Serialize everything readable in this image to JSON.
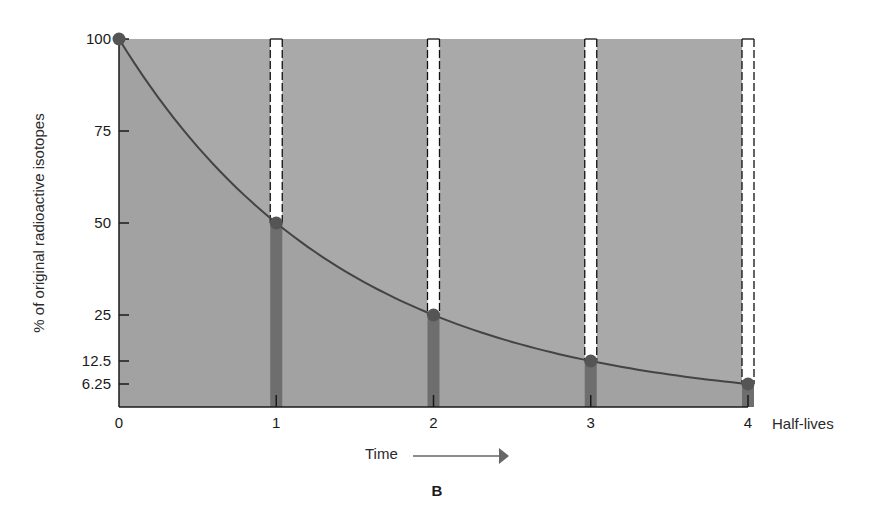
{
  "chart_data": {
    "type": "line",
    "title": "",
    "panel_label": "B",
    "xlabel": "Half-lives",
    "ylabel": "% of original radioactive isotopes",
    "time_label": "Time",
    "x": [
      0,
      1,
      2,
      3,
      4
    ],
    "series": [
      {
        "name": "Remaining radioactive isotopes",
        "values": [
          100,
          50,
          25,
          12.5,
          6.25
        ]
      }
    ],
    "x_ticks": [
      0,
      1,
      2,
      3,
      4
    ],
    "x_tick_labels": [
      "0",
      "1",
      "2",
      "3",
      "4"
    ],
    "y_ticks": [
      100,
      75,
      50,
      25,
      12.5,
      6.25
    ],
    "y_tick_labels": [
      "100",
      "75",
      "50",
      "25",
      "12.5",
      "6.25"
    ],
    "xlim": [
      0,
      4
    ],
    "ylim": [
      0,
      100
    ],
    "decayed_bars": [
      {
        "x": 1,
        "from": 50,
        "to": 100
      },
      {
        "x": 2,
        "from": 25,
        "to": 100
      },
      {
        "x": 3,
        "from": 12.5,
        "to": 100
      },
      {
        "x": 4,
        "from": 6.25,
        "to": 100
      }
    ],
    "remaining_bars": [
      {
        "x": 1,
        "value": 50
      },
      {
        "x": 2,
        "value": 25
      },
      {
        "x": 3,
        "value": 12.5
      },
      {
        "x": 4,
        "value": 6.25
      }
    ],
    "grid": false,
    "legend": "none"
  },
  "colors": {
    "background_fill": "#a9a9a9",
    "below_curve_fill": "#a2a2a2",
    "curve": "#444444",
    "points": "#555555",
    "remaining_bar": "#6e6e6e",
    "decayed_bar": "#ffffff",
    "axis": "#1a1a1a"
  }
}
